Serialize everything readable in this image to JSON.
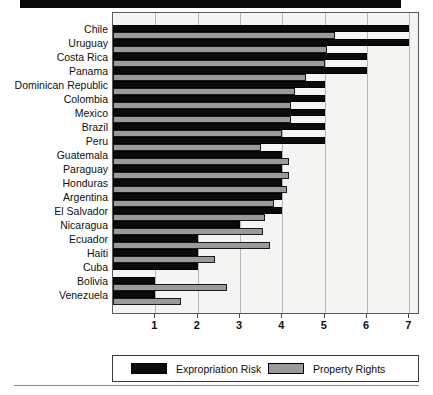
{
  "figure": {
    "top_rule": "decorative-top-rule",
    "bottom_rule": "decorative-bottom-rule"
  },
  "chart_data": {
    "type": "bar",
    "orientation": "horizontal",
    "title": "",
    "subtitle": "",
    "xlabel": "",
    "ylabel": "",
    "xlim": [
      0,
      7.25
    ],
    "xticks": [
      1,
      2,
      3,
      4,
      5,
      6,
      7
    ],
    "xtick_labels": [
      "1",
      "2",
      "3",
      "4",
      "5",
      "6",
      "7"
    ],
    "grid": true,
    "grid_axis": "x",
    "legend_position": "bottom",
    "categories": [
      "Chile",
      "Uruguay",
      "Costa Rica",
      "Panama",
      "Dominican Republic",
      "Colombia",
      "Mexico",
      "Brazil",
      "Peru",
      "Guatemala",
      "Paraguay",
      "Honduras",
      "Argentina",
      "El Salvador",
      "Nicaragua",
      "Ecuador",
      "Haiti",
      "Cuba",
      "Bolivia",
      "Venezuela"
    ],
    "series": [
      {
        "name": "Expropriation Risk",
        "color": "#0b0b0b",
        "values": [
          7.0,
          7.0,
          6.0,
          6.0,
          5.0,
          5.0,
          5.0,
          5.0,
          5.0,
          4.0,
          4.0,
          4.0,
          4.0,
          4.0,
          3.0,
          2.0,
          2.0,
          2.0,
          1.0,
          1.0
        ]
      },
      {
        "name": "Property Rights",
        "color": "#9a9a9a",
        "values": [
          5.25,
          5.05,
          5.0,
          4.55,
          4.3,
          4.2,
          4.2,
          4.0,
          3.5,
          4.15,
          4.15,
          4.1,
          3.8,
          3.6,
          3.55,
          3.7,
          2.4,
          0.0,
          2.7,
          1.6
        ]
      }
    ]
  },
  "legend": {
    "items": [
      {
        "label": "Expropriation Risk",
        "swatch": "black"
      },
      {
        "label": "Property Rights",
        "swatch": "gray"
      }
    ]
  }
}
